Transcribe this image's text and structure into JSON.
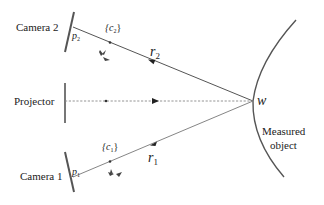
{
  "diagram": {
    "title": "",
    "labels": {
      "camera2": "Camera 2",
      "camera1": "Camera 1",
      "projector": "Projector",
      "measured_object_line1": "Measured",
      "measured_object_line2": "object",
      "w": "w",
      "p2": "p",
      "p2_sub": "2",
      "p1": "p",
      "p1_sub": "1",
      "c2_open": "{c",
      "c2_sub": "2",
      "c2_close": "}",
      "c1_open": "{c",
      "c1_sub": "1",
      "c1_close": "}",
      "r2": "r",
      "r2_sub": "2",
      "r1": "r",
      "r1_sub": "1"
    },
    "colors": {
      "stroke": "#555555",
      "text": "#222222",
      "dashed": "#888888"
    },
    "nodes": [
      {
        "id": "camera2",
        "label": "Camera 2"
      },
      {
        "id": "projector",
        "label": "Projector"
      },
      {
        "id": "camera1",
        "label": "Camera 1"
      },
      {
        "id": "w",
        "label": "w"
      },
      {
        "id": "measured-object",
        "label": "Measured object"
      }
    ],
    "edges": [
      {
        "from": "w",
        "to": "camera2",
        "label": "r2",
        "style": "solid"
      },
      {
        "from": "projector",
        "to": "w",
        "label": "",
        "style": "dashed"
      },
      {
        "from": "w",
        "to": "camera1",
        "label": "r1",
        "style": "solid"
      }
    ]
  }
}
